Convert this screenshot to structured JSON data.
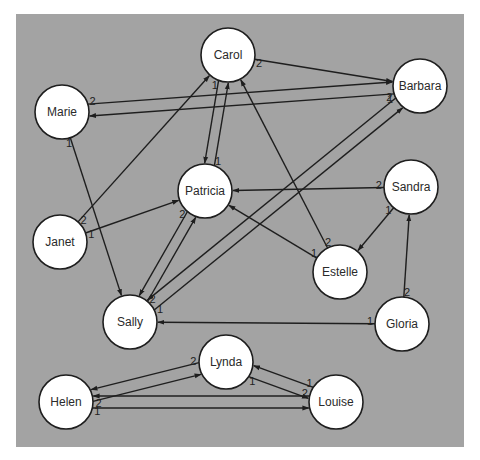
{
  "diagram": {
    "type": "sociogram",
    "colors": {
      "background": "#a3a3a3",
      "page": "#ffffff",
      "node_fill": "#ffffff",
      "node_stroke": "#1e1e1e",
      "edge": "#1e1e1e",
      "text": "#2a2a2a"
    },
    "frame": {
      "x": 16,
      "y": 14,
      "width": 448,
      "height": 433
    },
    "node_radius": 27,
    "nodes": [
      {
        "id": "carol",
        "label": "Carol",
        "x": 228,
        "y": 55
      },
      {
        "id": "barbara",
        "label": "Barbara",
        "x": 420,
        "y": 86
      },
      {
        "id": "marie",
        "label": "Marie",
        "x": 62,
        "y": 112
      },
      {
        "id": "patricia",
        "label": "Patricia",
        "x": 205,
        "y": 191
      },
      {
        "id": "sandra",
        "label": "Sandra",
        "x": 411,
        "y": 187
      },
      {
        "id": "janet",
        "label": "Janet",
        "x": 60,
        "y": 242
      },
      {
        "id": "estelle",
        "label": "Estelle",
        "x": 340,
        "y": 272
      },
      {
        "id": "sally",
        "label": "Sally",
        "x": 130,
        "y": 322
      },
      {
        "id": "gloria",
        "label": "Gloria",
        "x": 402,
        "y": 324
      },
      {
        "id": "lynda",
        "label": "Lynda",
        "x": 226,
        "y": 362
      },
      {
        "id": "helen",
        "label": "Helen",
        "x": 66,
        "y": 402
      },
      {
        "id": "louise",
        "label": "Louise",
        "x": 336,
        "y": 402
      }
    ],
    "edges": [
      {
        "from": "carol",
        "to": "barbara",
        "rank": "2",
        "offset": 0
      },
      {
        "from": "barbara",
        "to": "marie",
        "rank": "2",
        "offset": -6
      },
      {
        "from": "marie",
        "to": "barbara",
        "rank": "2",
        "offset": -6
      },
      {
        "from": "marie",
        "to": "sally",
        "rank": "1",
        "offset": 0
      },
      {
        "from": "janet",
        "to": "carol",
        "rank": "2",
        "offset": 0
      },
      {
        "from": "janet",
        "to": "patricia",
        "rank": "1",
        "offset": 0
      },
      {
        "from": "patricia",
        "to": "carol",
        "rank": "1",
        "offset": 5
      },
      {
        "from": "carol",
        "to": "patricia",
        "rank": "1",
        "offset": 5
      },
      {
        "from": "sandra",
        "to": "patricia",
        "rank": "2",
        "offset": 0
      },
      {
        "from": "sandra",
        "to": "estelle",
        "rank": "1",
        "offset": 0
      },
      {
        "from": "estelle",
        "to": "carol",
        "rank": "2",
        "offset": 0
      },
      {
        "from": "estelle",
        "to": "patricia",
        "rank": "1",
        "offset": 0
      },
      {
        "from": "patricia",
        "to": "sally",
        "rank": "2",
        "offset": 5
      },
      {
        "from": "sally",
        "to": "patricia",
        "rank": "2",
        "offset": 5
      },
      {
        "from": "barbara",
        "to": "sally",
        "rank": "1",
        "offset": 6
      },
      {
        "from": "sally",
        "to": "barbara",
        "rank": "1",
        "offset": 6
      },
      {
        "from": "gloria",
        "to": "sally",
        "rank": "1",
        "offset": 0
      },
      {
        "from": "gloria",
        "to": "sandra",
        "rank": "2",
        "offset": 0
      },
      {
        "from": "lynda",
        "to": "helen",
        "rank": "2",
        "offset": 6
      },
      {
        "from": "helen",
        "to": "lynda",
        "rank": "2",
        "offset": 6
      },
      {
        "from": "lynda",
        "to": "louise",
        "rank": "1",
        "offset": 6
      },
      {
        "from": "louise",
        "to": "lynda",
        "rank": "1",
        "offset": 6
      },
      {
        "from": "louise",
        "to": "helen",
        "rank": "2",
        "offset": 6
      },
      {
        "from": "helen",
        "to": "louise",
        "rank": "1",
        "offset": 6
      }
    ]
  }
}
